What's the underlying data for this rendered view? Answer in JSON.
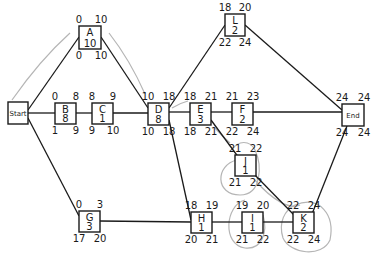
{
  "diagram": {
    "type": "activity-on-node network (critical path)",
    "nodes": [
      {
        "id": "start",
        "label": "Start",
        "duration": "",
        "es": "",
        "ef": "",
        "ls": "",
        "lf": "",
        "x": 8,
        "y": 102,
        "w": 20,
        "h": 22
      },
      {
        "id": "A",
        "label": "A",
        "duration": "10",
        "es": "0",
        "ef": "10",
        "ls": "0",
        "lf": "10",
        "x": 79,
        "y": 26,
        "w": 22,
        "h": 23
      },
      {
        "id": "B",
        "label": "B",
        "duration": "8",
        "es": "0",
        "ef": "8",
        "ls": "1",
        "lf": "9",
        "x": 55,
        "y": 103,
        "w": 21,
        "h": 21
      },
      {
        "id": "C",
        "label": "C",
        "duration": "1",
        "es": "8",
        "ef": "9",
        "ls": "9",
        "lf": "10",
        "x": 92,
        "y": 103,
        "w": 21,
        "h": 21
      },
      {
        "id": "D",
        "label": "D",
        "duration": "8",
        "es": "10",
        "ef": "18",
        "ls": "10",
        "lf": "18",
        "x": 148,
        "y": 103,
        "w": 21,
        "h": 22
      },
      {
        "id": "E",
        "label": "E",
        "duration": "3",
        "es": "18",
        "ef": "21",
        "ls": "18",
        "lf": "21",
        "x": 190,
        "y": 103,
        "w": 21,
        "h": 22
      },
      {
        "id": "F",
        "label": "F",
        "duration": "2",
        "es": "21",
        "ef": "23",
        "ls": "22",
        "lf": "24",
        "x": 232,
        "y": 103,
        "w": 21,
        "h": 22
      },
      {
        "id": "G",
        "label": "G",
        "duration": "3",
        "es": "0",
        "ef": "3",
        "ls": "17",
        "lf": "20",
        "x": 79,
        "y": 211,
        "w": 21,
        "h": 21
      },
      {
        "id": "H",
        "label": "H",
        "duration": "1",
        "es": "18",
        "ef": "19",
        "ls": "20",
        "lf": "21",
        "x": 191,
        "y": 212,
        "w": 21,
        "h": 21
      },
      {
        "id": "I",
        "label": "I",
        "duration": "1",
        "es": "19",
        "ef": "20",
        "ls": "21",
        "lf": "22",
        "x": 242,
        "y": 212,
        "w": 21,
        "h": 21
      },
      {
        "id": "J",
        "label": "J",
        "duration": "1",
        "es": "21",
        "ef": "22",
        "ls": "21",
        "lf": "22",
        "x": 235,
        "y": 155,
        "w": 21,
        "h": 21
      },
      {
        "id": "K",
        "label": "K",
        "duration": "2",
        "es": "22",
        "ef": "24",
        "ls": "22",
        "lf": "24",
        "x": 293,
        "y": 212,
        "w": 21,
        "h": 21
      },
      {
        "id": "L",
        "label": "L",
        "duration": "2",
        "es": "18",
        "ef": "20",
        "ls": "22",
        "lf": "24",
        "x": 225,
        "y": 14,
        "w": 20,
        "h": 22
      },
      {
        "id": "end",
        "label": "End",
        "duration": "",
        "es": "24",
        "ef": "24",
        "ls": "24",
        "lf": "24",
        "x": 342,
        "y": 104,
        "w": 22,
        "h": 22
      }
    ],
    "edges": [
      [
        "start",
        "A"
      ],
      [
        "start",
        "B"
      ],
      [
        "start",
        "G"
      ],
      [
        "A",
        "D"
      ],
      [
        "B",
        "C"
      ],
      [
        "C",
        "D"
      ],
      [
        "D",
        "E"
      ],
      [
        "D",
        "L"
      ],
      [
        "D",
        "H"
      ],
      [
        "E",
        "F"
      ],
      [
        "E",
        "J"
      ],
      [
        "F",
        "end"
      ],
      [
        "L",
        "end"
      ],
      [
        "G",
        "H"
      ],
      [
        "H",
        "I"
      ],
      [
        "I",
        "K"
      ],
      [
        "J",
        "K"
      ],
      [
        "K",
        "end"
      ]
    ],
    "critical_path": [
      "start",
      "A",
      "D",
      "E",
      "J",
      "K",
      "end"
    ],
    "project_duration": "24"
  }
}
